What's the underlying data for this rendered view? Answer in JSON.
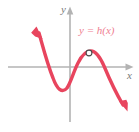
{
  "figure": {
    "kind": "graph",
    "background_color": "#ffffff",
    "axis_color": "#b3b3b3",
    "curve_color": "#e8455e",
    "label_color": "#ef7e91",
    "axis_label_color": "#7a7a7a",
    "labels": {
      "y_axis": "y",
      "x_axis": "x",
      "function": "y = h(x)"
    },
    "markers": {
      "open_circle": {
        "name": "removable-discontinuity",
        "x": 89,
        "y": 53,
        "fill": "#ffffff",
        "stroke": "#4a4a4a"
      }
    }
  },
  "chart_data": {
    "type": "line",
    "title": "",
    "xlabel": "x",
    "ylabel": "y",
    "series": [
      {
        "name": "y = h(x)",
        "color": "#e8455e",
        "points": [
          [
            38,
            31
          ],
          [
            44,
            45
          ],
          [
            48,
            57
          ],
          [
            52,
            72
          ],
          [
            56,
            86
          ],
          [
            60,
            92
          ],
          [
            64,
            91
          ],
          [
            68,
            83
          ],
          [
            72,
            70
          ],
          [
            78,
            60
          ],
          [
            84,
            54
          ],
          [
            90,
            51
          ],
          [
            96,
            52
          ],
          [
            102,
            58
          ],
          [
            108,
            70
          ],
          [
            114,
            84
          ],
          [
            120,
            98
          ],
          [
            125,
            107
          ]
        ],
        "arrow_start": {
          "at": [
            38,
            31
          ],
          "direction": "up-left"
        },
        "arrow_end": {
          "at": [
            125,
            107
          ],
          "direction": "down-right"
        }
      }
    ],
    "axes": {
      "x_axis_y_pixel": 67,
      "y_axis_x_pixel": 70,
      "x_axis_span": [
        8,
        131
      ],
      "y_axis_span": [
        8,
        122
      ],
      "x_axis_arrow": true,
      "y_axis_arrow": true,
      "grid": false
    },
    "annotations": [
      {
        "kind": "open-circle",
        "x": 89,
        "y": 53,
        "meaning": "hole in graph"
      },
      {
        "kind": "text",
        "text": "y = h(x)",
        "x": 79,
        "y": 30
      }
    ],
    "legend": null
  }
}
